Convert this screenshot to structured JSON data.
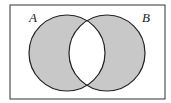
{
  "diagram": {
    "type": "venn",
    "sets": [
      {
        "label": "A"
      },
      {
        "label": "B"
      }
    ],
    "shaded_region": "symmetric difference (A xor B)",
    "colors": {
      "shade": "#c8c8c8",
      "stroke": "#222222",
      "background": "#ffffff"
    }
  }
}
